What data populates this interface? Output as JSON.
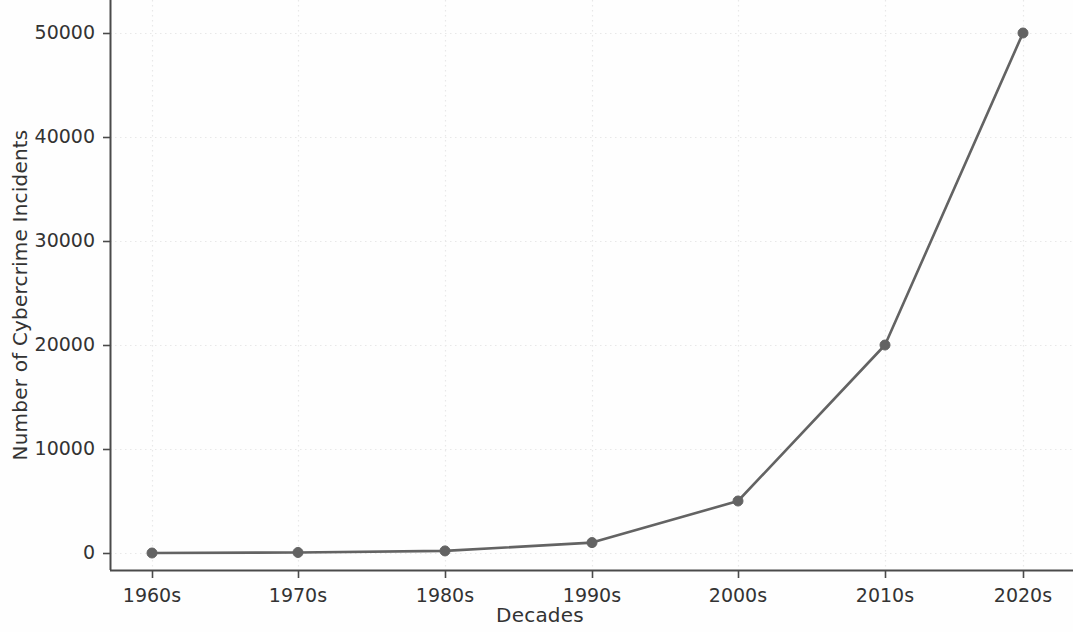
{
  "chart_data": {
    "type": "line",
    "title": "",
    "xlabel": "Decades",
    "ylabel": "Number of Cybercrime Incidents",
    "categories": [
      "1960s",
      "1970s",
      "1980s",
      "1990s",
      "2000s",
      "2010s",
      "2020s"
    ],
    "values": [
      0,
      50,
      200,
      1000,
      5000,
      20000,
      50000
    ],
    "series": [
      {
        "name": "Number of Cybercrime Incidents",
        "values": [
          0,
          50,
          200,
          1000,
          5000,
          20000,
          50000
        ]
      }
    ],
    "ylim": [
      -1500,
      51500
    ],
    "yticks": [
      0,
      10000,
      20000,
      30000,
      40000,
      50000
    ],
    "ytick_labels": [
      "0",
      "10000",
      "20000",
      "30000",
      "40000",
      "50000"
    ],
    "xtick_labels": [
      "1960s",
      "1970s",
      "1980s",
      "1990s",
      "2000s",
      "2010s",
      "2020s"
    ],
    "grid": true,
    "grid_style": "dotted",
    "legend": false,
    "legend_position": "none",
    "line_color": "#636363",
    "marker": "circle",
    "marker_color": "#636363",
    "grid_color": "#e8e8e8",
    "axis_color": "#4a4a4a",
    "background_color": "#ffffff"
  }
}
